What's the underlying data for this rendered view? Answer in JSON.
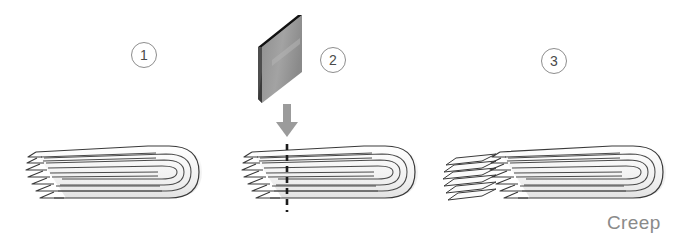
{
  "figure": {
    "annotation": "Creep",
    "background_color": "#ffffff"
  },
  "steps": [
    {
      "number": "1",
      "name": "folded-ply-stack"
    },
    {
      "number": "2",
      "name": "blade-cutting-stack"
    },
    {
      "number": "3",
      "name": "trimmed-stack-and-offcut"
    }
  ],
  "colors": {
    "outline": "#3a3a3a",
    "fold_line": "#4a4a4a",
    "sheet_fill": "#fdfdfd",
    "end_shade": "#f0f0f0",
    "blade_face": "#9a9a9a",
    "blade_edge": "#111111",
    "blade_dark": "#4e4e4e",
    "arrow": "#9b9b9b",
    "cut_line": "#1c1c1c",
    "badge_border": "#8d8d8d",
    "badge_text": "#4a4a4a",
    "label_text": "#8a8a8a"
  },
  "cut_line": {
    "name": "dashed-cut-line",
    "x": 287,
    "y_top": 144,
    "y_bottom": 212,
    "style": "dashed"
  },
  "arrow": {
    "name": "downward-press-arrow",
    "x": 287,
    "y_top": 104,
    "y_bottom": 136,
    "direction": "down"
  },
  "blade": {
    "name": "cutting-blade",
    "shape": "parallelogram-plate"
  }
}
